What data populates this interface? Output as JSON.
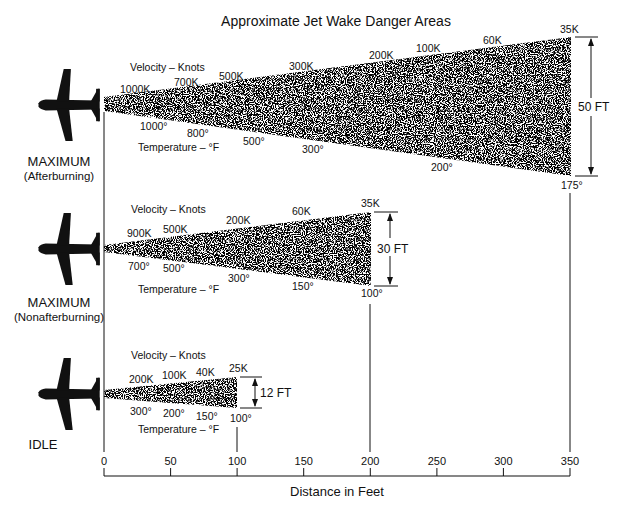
{
  "title": "Approximate Jet Wake Danger Areas",
  "axis": {
    "label": "Distance in Feet",
    "unit": "ft",
    "min": 0,
    "max": 350,
    "ticks": [
      "0",
      "50",
      "100",
      "150",
      "200",
      "250",
      "300",
      "350"
    ]
  },
  "common_labels": {
    "velocity": "Velocity – Knots",
    "temperature": "Temperature – °F"
  },
  "panels": [
    {
      "id": "max-afterburning",
      "mode": "MAXIMUM",
      "submode": "(Afterburning)",
      "length_ft": 350,
      "width_label": "50 FT",
      "width_ft": 50,
      "velocity_labels": [
        "1000K",
        "700K",
        "500K",
        "300K",
        "200K",
        "100K",
        "60K",
        "35K"
      ],
      "temperature_labels": [
        "1000°",
        "800°",
        "500°",
        "300°",
        "200°",
        "175°"
      ]
    },
    {
      "id": "max-nonafterburning",
      "mode": "MAXIMUM",
      "submode": "(Nonafterburning)",
      "length_ft": 200,
      "width_label": "30 FT",
      "width_ft": 30,
      "velocity_labels": [
        "900K",
        "500K",
        "200K",
        "60K",
        "35K"
      ],
      "temperature_labels": [
        "700°",
        "500°",
        "300°",
        "150°",
        "100°"
      ]
    },
    {
      "id": "idle",
      "mode": "IDLE",
      "submode": "",
      "length_ft": 100,
      "width_label": "12 FT",
      "width_ft": 12,
      "velocity_labels": [
        "200K",
        "100K",
        "40K",
        "25K"
      ],
      "temperature_labels": [
        "300°",
        "200°",
        "150°",
        "100°"
      ]
    }
  ],
  "icons": {
    "aircraft": "jet-aircraft-silhouette-icon",
    "dimension_arrow": "double-headed-arrow-icon"
  },
  "colors": {
    "ink": "#111111",
    "background": "#ffffff"
  }
}
